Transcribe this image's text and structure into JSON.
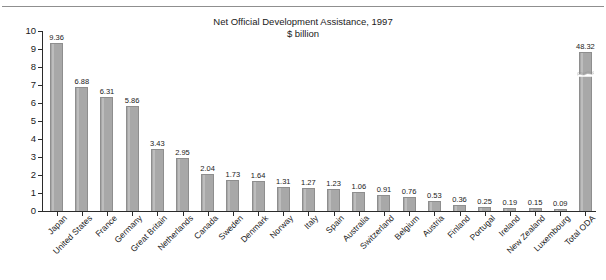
{
  "page": {
    "clipped_header_text": ""
  },
  "chart_data": {
    "type": "bar",
    "title": "Net Official Development Assistance, 1997",
    "subtitle": "$ billion",
    "xlabel": "",
    "ylabel": "",
    "ylim": [
      0,
      10
    ],
    "yticks": [
      0,
      1,
      2,
      3,
      4,
      5,
      6,
      7,
      8,
      9,
      10
    ],
    "ytick_labels": [
      "0",
      "1",
      "2",
      "3",
      "4",
      "5",
      "6",
      "7",
      "8",
      "9",
      "10"
    ],
    "grid": false,
    "legend": "none",
    "axis_break": {
      "present": true,
      "category": "Total ODA",
      "note": "broken-axis bar drawn truncated with wave mark"
    },
    "categories": [
      "Japan",
      "United States",
      "France",
      "Germany",
      "Great Britain",
      "Netherlands",
      "Canada",
      "Sweden",
      "Denmark",
      "Norway",
      "Italy",
      "Spain",
      "Australia",
      "Switzerland",
      "Belgium",
      "Austria",
      "Finland",
      "Portugal",
      "Ireland",
      "New Zealand",
      "Luxembourg",
      "Total ODA"
    ],
    "values": [
      9.36,
      6.88,
      6.31,
      5.86,
      3.43,
      2.95,
      2.04,
      1.73,
      1.64,
      1.31,
      1.27,
      1.23,
      1.06,
      0.91,
      0.76,
      0.53,
      0.36,
      0.25,
      0.19,
      0.15,
      0.09,
      48.32
    ],
    "value_labels": [
      "9.36",
      "6.88",
      "6.31",
      "5.86",
      "3.43",
      "2.95",
      "2.04",
      "1.73",
      "1.64",
      "1.31",
      "1.27",
      "1.23",
      "1.06",
      "0.91",
      "0.76",
      "0.53",
      "0.36",
      "0.25",
      "0.19",
      "0.15",
      "0.09",
      "48.32"
    ],
    "bar_color": "#a8a8a8",
    "axis_color": "#2b2b2b"
  }
}
